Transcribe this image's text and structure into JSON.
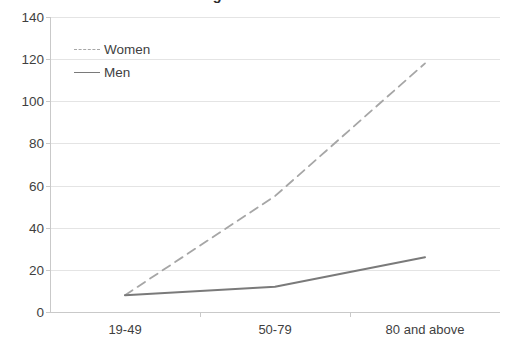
{
  "chart_data": {
    "type": "line",
    "title": "Among Men and Women",
    "title_cropped": true,
    "xlabel": "",
    "ylabel": "",
    "categories": [
      "19-49",
      "50-79",
      "80 and above"
    ],
    "yticks": [
      0,
      20,
      40,
      60,
      80,
      100,
      120,
      140
    ],
    "ylim": [
      0,
      140
    ],
    "grid": true,
    "legend_position": "upper-left-inside",
    "series": [
      {
        "name": "Women",
        "style": "dashed",
        "color": "#a6a6a6",
        "values": [
          8,
          55,
          118
        ]
      },
      {
        "name": "Men",
        "style": "solid",
        "color": "#7a7a7a",
        "values": [
          8,
          12,
          26
        ]
      }
    ]
  },
  "colors": {
    "women_line": "#a6a6a6",
    "men_line": "#7a7a7a",
    "gridline": "#e4e4e4",
    "axis": "#c9c9c9",
    "text": "#3f3f3f",
    "background": "#ffffff"
  }
}
